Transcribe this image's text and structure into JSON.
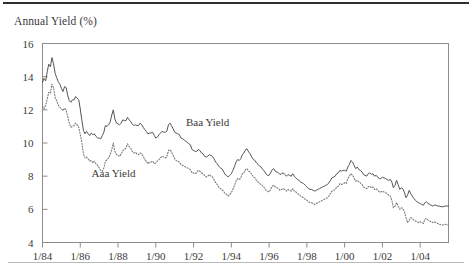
{
  "chart_data": {
    "type": "line",
    "title": "Annual Yield (%)",
    "xlabel": "",
    "ylabel": "Annual Yield (%)",
    "ylim": [
      4,
      16
    ],
    "ytick_values": [
      4,
      6,
      8,
      10,
      12,
      14,
      16
    ],
    "ytick_labels": [
      "4",
      "6",
      "8",
      "10",
      "12",
      "14",
      "16"
    ],
    "xlim": [
      1984.0,
      2005.5
    ],
    "xtick_values": [
      1984,
      1986,
      1988,
      1990,
      1992,
      1994,
      1996,
      1998,
      2000,
      2002,
      2004
    ],
    "xtick_labels": [
      "1/84",
      "1/86",
      "1/88",
      "1/90",
      "1/92",
      "1/94",
      "1/96",
      "1/98",
      "1/00",
      "1/02",
      "1/04"
    ],
    "grid": false,
    "legend_position": "inline-annotations",
    "annotations": [
      {
        "text": "Baa Yield",
        "x": 1991.6,
        "y": 11.05
      },
      {
        "text": "Aaa Yield",
        "x": 1986.6,
        "y": 7.95
      }
    ],
    "series": [
      {
        "name": "Baa Yield",
        "style": "solid",
        "color": "#555555",
        "x": [
          1984.0,
          1984.08,
          1984.17,
          1984.25,
          1984.33,
          1984.42,
          1984.5,
          1984.58,
          1984.67,
          1984.75,
          1984.83,
          1984.92,
          1985.0,
          1985.08,
          1985.17,
          1985.25,
          1985.33,
          1985.42,
          1985.5,
          1985.58,
          1985.67,
          1985.75,
          1985.83,
          1985.92,
          1986.0,
          1986.08,
          1986.17,
          1986.25,
          1986.33,
          1986.42,
          1986.5,
          1986.58,
          1986.67,
          1986.75,
          1986.83,
          1986.92,
          1987.0,
          1987.08,
          1987.17,
          1987.25,
          1987.33,
          1987.42,
          1987.5,
          1987.58,
          1987.67,
          1987.75,
          1987.83,
          1987.92,
          1988.0,
          1988.08,
          1988.17,
          1988.25,
          1988.33,
          1988.42,
          1988.5,
          1988.58,
          1988.67,
          1988.75,
          1988.83,
          1988.92,
          1989.0,
          1989.08,
          1989.17,
          1989.25,
          1989.33,
          1989.42,
          1989.5,
          1989.58,
          1989.67,
          1989.75,
          1989.83,
          1989.92,
          1990.0,
          1990.08,
          1990.17,
          1990.25,
          1990.33,
          1990.42,
          1990.5,
          1990.58,
          1990.67,
          1990.75,
          1990.83,
          1990.92,
          1991.0,
          1991.08,
          1991.17,
          1991.25,
          1991.33,
          1991.42,
          1991.5,
          1991.58,
          1991.67,
          1991.75,
          1991.83,
          1991.92,
          1992.0,
          1992.08,
          1992.17,
          1992.25,
          1992.33,
          1992.42,
          1992.5,
          1992.58,
          1992.67,
          1992.75,
          1992.83,
          1992.92,
          1993.0,
          1993.08,
          1993.17,
          1993.25,
          1993.33,
          1993.42,
          1993.5,
          1993.58,
          1993.67,
          1993.75,
          1993.83,
          1993.92,
          1994.0,
          1994.08,
          1994.17,
          1994.25,
          1994.33,
          1994.42,
          1994.5,
          1994.58,
          1994.67,
          1994.75,
          1994.83,
          1994.92,
          1995.0,
          1995.08,
          1995.17,
          1995.25,
          1995.33,
          1995.42,
          1995.5,
          1995.58,
          1995.67,
          1995.75,
          1995.83,
          1995.92,
          1996.0,
          1996.08,
          1996.17,
          1996.25,
          1996.33,
          1996.42,
          1996.5,
          1996.58,
          1996.67,
          1996.75,
          1996.83,
          1996.92,
          1997.0,
          1997.08,
          1997.17,
          1997.25,
          1997.33,
          1997.42,
          1997.5,
          1997.58,
          1997.67,
          1997.75,
          1997.83,
          1997.92,
          1998.0,
          1998.08,
          1998.17,
          1998.25,
          1998.33,
          1998.42,
          1998.5,
          1998.58,
          1998.67,
          1998.75,
          1998.83,
          1998.92,
          1999.0,
          1999.08,
          1999.17,
          1999.25,
          1999.33,
          1999.42,
          1999.5,
          1999.58,
          1999.67,
          1999.75,
          1999.83,
          1999.92,
          2000.0,
          2000.08,
          2000.17,
          2000.25,
          2000.33,
          2000.42,
          2000.5,
          2000.58,
          2000.67,
          2000.75,
          2000.83,
          2000.92,
          2001.0,
          2001.08,
          2001.17,
          2001.25,
          2001.33,
          2001.42,
          2001.5,
          2001.58,
          2001.67,
          2001.75,
          2001.83,
          2001.92,
          2002.0,
          2002.08,
          2002.17,
          2002.25,
          2002.33,
          2002.42,
          2002.5,
          2002.58,
          2002.67,
          2002.75,
          2002.83,
          2002.92,
          2003.0,
          2003.08,
          2003.17,
          2003.25,
          2003.33,
          2003.42,
          2003.5,
          2003.58,
          2003.67,
          2003.75,
          2003.83,
          2003.92,
          2004.0,
          2004.08,
          2004.17,
          2004.25,
          2004.33,
          2004.42,
          2004.5,
          2004.58,
          2004.67,
          2004.75,
          2004.83,
          2004.92,
          2005.0,
          2005.17,
          2005.33,
          2005.5
        ],
        "y": [
          13.65,
          13.9,
          13.75,
          14.3,
          14.75,
          14.6,
          15.15,
          14.8,
          14.2,
          13.95,
          13.7,
          13.55,
          13.3,
          13.1,
          13.4,
          13.35,
          12.9,
          12.55,
          12.45,
          12.6,
          12.6,
          12.8,
          12.7,
          12.6,
          12.05,
          11.4,
          10.75,
          10.55,
          10.7,
          10.55,
          10.45,
          10.6,
          10.5,
          10.55,
          10.4,
          10.3,
          10.3,
          10.25,
          10.45,
          10.65,
          11.05,
          11.0,
          11.1,
          11.25,
          11.7,
          12.0,
          11.45,
          11.2,
          11.15,
          11.1,
          11.2,
          11.4,
          11.35,
          11.35,
          11.55,
          11.4,
          11.3,
          11.15,
          11.05,
          11.1,
          11.05,
          11.05,
          11.2,
          11.1,
          10.95,
          10.8,
          10.7,
          10.55,
          10.6,
          10.6,
          10.65,
          10.45,
          10.3,
          10.35,
          10.5,
          10.6,
          10.7,
          10.65,
          10.65,
          10.7,
          11.1,
          11.2,
          11.05,
          10.85,
          10.65,
          10.6,
          10.55,
          10.5,
          10.3,
          10.25,
          10.2,
          10.1,
          10.05,
          9.95,
          9.9,
          9.6,
          9.55,
          9.5,
          9.5,
          9.6,
          9.55,
          9.4,
          9.35,
          9.2,
          9.15,
          9.2,
          9.3,
          9.25,
          9.2,
          9.05,
          8.85,
          8.75,
          8.6,
          8.5,
          8.45,
          8.3,
          8.1,
          8.05,
          7.95,
          8.05,
          8.15,
          8.35,
          8.6,
          8.85,
          9.0,
          8.95,
          9.05,
          9.3,
          9.4,
          9.6,
          9.65,
          9.45,
          9.35,
          9.15,
          9.0,
          8.95,
          8.8,
          8.7,
          8.6,
          8.55,
          8.4,
          8.3,
          8.15,
          8.05,
          8.05,
          8.2,
          8.4,
          8.45,
          8.3,
          8.25,
          8.2,
          8.1,
          8.15,
          8.2,
          8.1,
          8.0,
          8.1,
          8.05,
          8.0,
          8.15,
          8.0,
          7.9,
          7.8,
          7.75,
          7.65,
          7.6,
          7.55,
          7.45,
          7.35,
          7.25,
          7.2,
          7.2,
          7.15,
          7.1,
          7.15,
          7.2,
          7.25,
          7.3,
          7.35,
          7.4,
          7.45,
          7.5,
          7.6,
          7.75,
          7.9,
          7.95,
          8.0,
          8.15,
          8.2,
          8.35,
          8.3,
          8.35,
          8.35,
          8.3,
          8.55,
          8.7,
          8.95,
          8.85,
          8.65,
          8.45,
          8.55,
          8.4,
          8.35,
          8.25,
          8.1,
          8.05,
          8.0,
          8.15,
          8.2,
          8.1,
          8.15,
          8.0,
          8.05,
          7.95,
          7.85,
          7.85,
          7.95,
          7.9,
          7.85,
          7.8,
          7.75,
          7.8,
          7.65,
          7.3,
          7.45,
          7.75,
          7.5,
          7.2,
          7.3,
          7.25,
          7.0,
          6.7,
          6.85,
          7.15,
          6.95,
          6.8,
          6.65,
          6.55,
          6.45,
          6.4,
          6.35,
          6.3,
          6.25,
          6.4,
          6.45,
          6.35,
          6.3,
          6.25,
          6.2,
          6.25,
          6.25,
          6.2,
          6.2,
          6.15,
          6.2,
          6.2
        ]
      },
      {
        "name": "Aaa Yield",
        "style": "dotted",
        "color": "#7a7a7a",
        "x": [
          1984.0,
          1984.08,
          1984.17,
          1984.25,
          1984.33,
          1984.42,
          1984.5,
          1984.58,
          1984.67,
          1984.75,
          1984.83,
          1984.92,
          1985.0,
          1985.08,
          1985.17,
          1985.25,
          1985.33,
          1985.42,
          1985.5,
          1985.58,
          1985.67,
          1985.75,
          1985.83,
          1985.92,
          1986.0,
          1986.08,
          1986.17,
          1986.25,
          1986.33,
          1986.42,
          1986.5,
          1986.58,
          1986.67,
          1986.75,
          1986.83,
          1986.92,
          1987.0,
          1987.08,
          1987.17,
          1987.25,
          1987.33,
          1987.42,
          1987.5,
          1987.58,
          1987.67,
          1987.75,
          1987.83,
          1987.92,
          1988.0,
          1988.08,
          1988.17,
          1988.25,
          1988.33,
          1988.42,
          1988.5,
          1988.58,
          1988.67,
          1988.75,
          1988.83,
          1988.92,
          1989.0,
          1989.08,
          1989.17,
          1989.25,
          1989.33,
          1989.42,
          1989.5,
          1989.58,
          1989.67,
          1989.75,
          1989.83,
          1989.92,
          1990.0,
          1990.08,
          1990.17,
          1990.25,
          1990.33,
          1990.42,
          1990.5,
          1990.58,
          1990.67,
          1990.75,
          1990.83,
          1990.92,
          1991.0,
          1991.08,
          1991.17,
          1991.25,
          1991.33,
          1991.42,
          1991.5,
          1991.58,
          1991.67,
          1991.75,
          1991.83,
          1991.92,
          1992.0,
          1992.08,
          1992.17,
          1992.25,
          1992.33,
          1992.42,
          1992.5,
          1992.58,
          1992.67,
          1992.75,
          1992.83,
          1992.92,
          1993.0,
          1993.08,
          1993.17,
          1993.25,
          1993.33,
          1993.42,
          1993.5,
          1993.58,
          1993.67,
          1993.75,
          1993.83,
          1993.92,
          1994.0,
          1994.08,
          1994.17,
          1994.25,
          1994.33,
          1994.42,
          1994.5,
          1994.58,
          1994.67,
          1994.75,
          1994.83,
          1994.92,
          1995.0,
          1995.08,
          1995.17,
          1995.25,
          1995.33,
          1995.42,
          1995.5,
          1995.58,
          1995.67,
          1995.75,
          1995.83,
          1995.92,
          1996.0,
          1996.08,
          1996.17,
          1996.25,
          1996.33,
          1996.42,
          1996.5,
          1996.58,
          1996.67,
          1996.75,
          1996.83,
          1996.92,
          1997.0,
          1997.08,
          1997.17,
          1997.25,
          1997.33,
          1997.42,
          1997.5,
          1997.58,
          1997.67,
          1997.75,
          1997.83,
          1997.92,
          1998.0,
          1998.08,
          1998.17,
          1998.25,
          1998.33,
          1998.42,
          1998.5,
          1998.58,
          1998.67,
          1998.75,
          1998.83,
          1998.92,
          1999.0,
          1999.08,
          1999.17,
          1999.25,
          1999.33,
          1999.42,
          1999.5,
          1999.58,
          1999.67,
          1999.75,
          1999.83,
          1999.92,
          2000.0,
          2000.08,
          2000.17,
          2000.25,
          2000.33,
          2000.42,
          2000.5,
          2000.58,
          2000.67,
          2000.75,
          2000.83,
          2000.92,
          2001.0,
          2001.08,
          2001.17,
          2001.25,
          2001.33,
          2001.42,
          2001.5,
          2001.58,
          2001.67,
          2001.75,
          2001.83,
          2001.92,
          2002.0,
          2002.08,
          2002.17,
          2002.25,
          2002.33,
          2002.42,
          2002.5,
          2002.58,
          2002.67,
          2002.75,
          2002.83,
          2002.92,
          2003.0,
          2003.08,
          2003.17,
          2003.25,
          2003.33,
          2003.42,
          2003.5,
          2003.58,
          2003.67,
          2003.75,
          2003.83,
          2003.92,
          2004.0,
          2004.08,
          2004.17,
          2004.25,
          2004.33,
          2004.42,
          2004.5,
          2004.58,
          2004.67,
          2004.75,
          2004.83,
          2004.92,
          2005.0,
          2005.17,
          2005.33,
          2005.5
        ],
        "y": [
          12.2,
          12.05,
          12.3,
          12.65,
          13.05,
          13.0,
          13.55,
          13.35,
          12.75,
          12.55,
          12.3,
          12.15,
          12.05,
          11.95,
          12.1,
          12.0,
          11.6,
          11.2,
          10.95,
          11.0,
          11.05,
          11.2,
          11.1,
          10.95,
          10.5,
          10.05,
          9.35,
          9.1,
          9.15,
          9.05,
          8.9,
          8.95,
          8.8,
          8.9,
          8.75,
          8.65,
          8.5,
          8.35,
          8.3,
          8.5,
          8.9,
          9.0,
          9.1,
          9.3,
          9.6,
          10.0,
          9.5,
          9.3,
          9.25,
          9.2,
          9.35,
          9.55,
          9.6,
          9.7,
          9.95,
          9.8,
          9.7,
          9.5,
          9.4,
          9.45,
          9.35,
          9.3,
          9.4,
          9.35,
          9.2,
          9.0,
          8.9,
          8.75,
          8.85,
          8.85,
          8.9,
          8.75,
          8.8,
          8.9,
          9.0,
          9.1,
          9.2,
          9.15,
          9.1,
          9.15,
          9.55,
          9.6,
          9.45,
          9.25,
          9.05,
          8.95,
          8.9,
          8.85,
          8.7,
          8.65,
          8.6,
          8.55,
          8.5,
          8.45,
          8.4,
          8.2,
          8.2,
          8.15,
          8.2,
          8.35,
          8.3,
          8.2,
          8.15,
          8.05,
          7.95,
          8.0,
          8.1,
          8.0,
          7.95,
          7.8,
          7.6,
          7.5,
          7.35,
          7.25,
          7.2,
          7.1,
          6.95,
          6.9,
          6.8,
          6.9,
          7.0,
          7.2,
          7.45,
          7.7,
          7.85,
          7.8,
          7.9,
          8.15,
          8.2,
          8.4,
          8.45,
          8.3,
          8.25,
          8.1,
          7.95,
          7.9,
          7.75,
          7.65,
          7.55,
          7.5,
          7.4,
          7.3,
          7.15,
          7.1,
          7.05,
          7.2,
          7.4,
          7.45,
          7.35,
          7.3,
          7.25,
          7.15,
          7.2,
          7.25,
          7.2,
          7.1,
          7.2,
          7.15,
          7.1,
          7.25,
          7.1,
          7.05,
          6.95,
          6.9,
          6.8,
          6.75,
          6.7,
          6.6,
          6.55,
          6.45,
          6.4,
          6.4,
          6.35,
          6.3,
          6.35,
          6.4,
          6.45,
          6.5,
          6.55,
          6.6,
          6.65,
          6.7,
          6.8,
          6.95,
          7.1,
          7.15,
          7.2,
          7.35,
          7.4,
          7.55,
          7.5,
          7.55,
          7.6,
          7.55,
          7.85,
          8.0,
          8.15,
          8.05,
          7.9,
          7.7,
          7.75,
          7.65,
          7.6,
          7.5,
          7.35,
          7.3,
          7.25,
          7.35,
          7.4,
          7.3,
          7.35,
          7.2,
          7.25,
          7.15,
          7.05,
          7.05,
          7.1,
          7.05,
          7.0,
          6.95,
          6.85,
          6.8,
          6.55,
          6.1,
          6.2,
          6.4,
          6.2,
          6.0,
          6.1,
          6.05,
          5.85,
          5.5,
          5.2,
          5.35,
          5.5,
          5.45,
          5.35,
          5.3,
          5.25,
          5.2,
          5.25,
          5.2,
          5.15,
          5.4,
          5.45,
          5.35,
          5.3,
          5.25,
          5.2,
          5.25,
          5.2,
          5.15,
          5.1,
          5.05,
          5.1,
          5.05
        ]
      }
    ]
  },
  "figure": {
    "title": "Annual Yield (%)",
    "top_rule": "horizontal-rule",
    "bottom_rule": "horizontal-rule"
  }
}
